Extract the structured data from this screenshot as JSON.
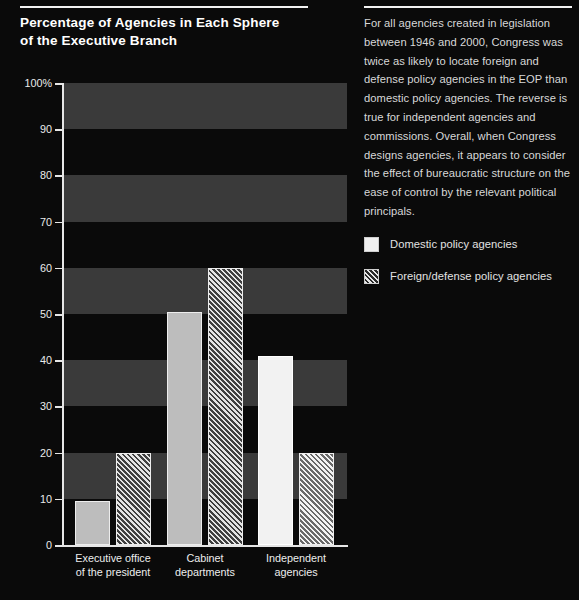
{
  "title": {
    "line1": "Percentage of Agencies in Each Sphere",
    "line2": "of the Executive Branch"
  },
  "sidebar": {
    "blurb": "For all agencies created in legislation between 1946 and 2000, Congress was twice as likely to locate foreign and defense policy agencies in the EOP than domestic policy agencies. The reverse is true for independent agencies and commissions. Overall, when Congress designs agencies, it appears to consider the effect of bureaucratic structure on the ease of control by the relevant political principals."
  },
  "legend": {
    "items": [
      {
        "label": "Domestic policy agencies",
        "swatch": "solid-white"
      },
      {
        "label": "Foreign/defense policy agencies",
        "swatch": "diagonal-hatch"
      }
    ]
  },
  "axis": {
    "y_ticks": [
      "100%",
      "90",
      "80",
      "70",
      "60",
      "50",
      "40",
      "30",
      "20",
      "10",
      "0"
    ],
    "x_labels": [
      {
        "line1": "Executive office",
        "line2": "of the president"
      },
      {
        "line1": "Cabinet",
        "line2": "departments"
      },
      {
        "line1": "Independent",
        "line2": "agencies"
      }
    ]
  },
  "colors": {
    "background": "#0a0a0a",
    "band": "#3a3a3a",
    "axis": "#e6e6e6",
    "bar_domestic": "#bdbdbd",
    "bar_foreign_fill": "#3f3f3f",
    "bar_outline": "#ededed",
    "text": "#e9e9e9"
  },
  "chart_data": {
    "type": "bar",
    "title": "Percentage of Agencies in Each Sphere of the Executive Branch",
    "xlabel": "",
    "ylabel": "",
    "ylim": [
      0,
      100
    ],
    "ytick_values": [
      0,
      10,
      20,
      30,
      40,
      50,
      60,
      70,
      80,
      90,
      100
    ],
    "grid": "horizontal-alternating-bands",
    "legend_position": "right",
    "categories": [
      "Executive office of the president",
      "Cabinet departments",
      "Independent agencies"
    ],
    "series": [
      {
        "name": "Domestic policy agencies",
        "values": [
          9.5,
          50.5,
          41
        ]
      },
      {
        "name": "Foreign/defense policy agencies",
        "values": [
          20,
          60,
          20
        ]
      }
    ]
  }
}
